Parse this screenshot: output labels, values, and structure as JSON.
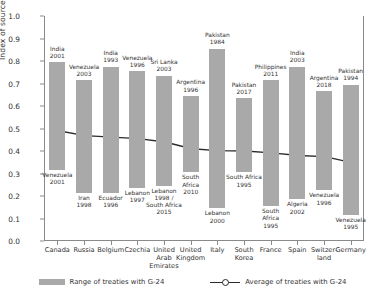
{
  "chart_data": {
    "type": "bar",
    "title": "",
    "subtitle": "",
    "xlabel": "",
    "ylabel": "Index of source taxing rights",
    "ylim": [
      0.0,
      1.0
    ],
    "ytick_labels": [
      "0.0",
      "0.1",
      "0.2",
      "0.3",
      "0.4",
      "0.5",
      "0.6",
      "0.7",
      "0.8",
      "0.9",
      "1.0"
    ],
    "ytick_values": [
      0.0,
      0.1,
      0.2,
      0.3,
      0.4,
      0.5,
      0.6,
      0.7,
      0.8,
      0.9,
      1.0
    ],
    "grid": false,
    "legend_position": "bottom",
    "categories": [
      "Canada",
      "Russia",
      "Belgium",
      "Czechia",
      "United\nArab\nEmirates",
      "United\nKingdom",
      "Italy",
      "South\nKorea",
      "France",
      "Spain",
      "Switzer-\nland",
      "Germany"
    ],
    "series": [
      {
        "name": "Range of treaties with G-24",
        "type": "range-bar",
        "color": "#a9a9a9",
        "high": [
          0.795,
          0.715,
          0.775,
          0.755,
          0.735,
          0.645,
          0.855,
          0.635,
          0.715,
          0.775,
          0.665,
          0.695
        ],
        "low": [
          0.315,
          0.215,
          0.215,
          0.235,
          0.245,
          0.305,
          0.145,
          0.305,
          0.155,
          0.185,
          0.225,
          0.115
        ],
        "high_labels": [
          "India\n2001",
          "Venezuela\n2003",
          "India\n1993",
          "Venezuela\n1996",
          "Sri Lanka\n2003",
          "Argentina\n1996",
          "Pakistan\n1984",
          "Pakistan\n2017",
          "Philippines\n2011",
          "India\n2003",
          "Argentina\n2018",
          "Pakistan\n1994"
        ],
        "low_labels": [
          "Venezuela\n2001",
          "Iran\n1998",
          "Ecuador\n1996",
          "Lebanon\n1997",
          "Lebanon\n1998 /\nSouth Africa\n2015",
          "South\nAfrica\n2010",
          "Lebanon\n2000",
          "South Africa\n1995",
          "South\nAfrica\n1995",
          "Algeria\n2002",
          "Venezuela\n1996",
          "Venezuela\n1995"
        ]
      },
      {
        "name": "Average of treaties with G-24",
        "type": "line",
        "color": "#2b2b2b",
        "marker": "circle-open",
        "values": [
          0.49,
          0.468,
          0.462,
          0.455,
          0.44,
          0.41,
          0.402,
          0.4,
          0.392,
          0.38,
          0.375,
          0.348
        ]
      }
    ],
    "legend": [
      {
        "label": "Range of treaties with G-24",
        "marker": "swatch",
        "color": "#a9a9a9"
      },
      {
        "label": "Average of treaties with G-24",
        "marker": "line-circle",
        "color": "#2b2b2b"
      }
    ]
  }
}
